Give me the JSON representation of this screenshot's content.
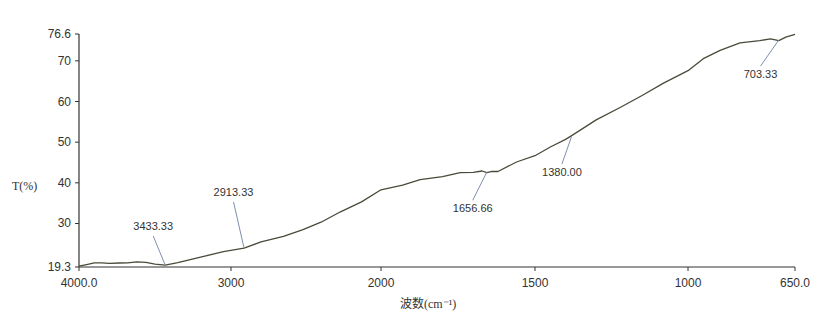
{
  "chart_data": {
    "type": "line",
    "title": "",
    "xlabel": "波数(cm⁻¹)",
    "ylabel": "T(%)",
    "xlim": [
      4000.0,
      650.0
    ],
    "ylim": [
      19.3,
      76.6
    ],
    "x_reversed": true,
    "x_scale_break": 2000,
    "grid": false,
    "legend": null,
    "x_ticks": [
      {
        "value": 4000,
        "label": "4000.0"
      },
      {
        "value": 3000,
        "label": "3000"
      },
      {
        "value": 2000,
        "label": "2000"
      },
      {
        "value": 1500,
        "label": "1500"
      },
      {
        "value": 1000,
        "label": "1000"
      },
      {
        "value": 650,
        "label": "650.0"
      }
    ],
    "y_ticks": [
      {
        "value": 19.3,
        "label": "19.3"
      },
      {
        "value": 30,
        "label": "30"
      },
      {
        "value": 40,
        "label": "40"
      },
      {
        "value": 50,
        "label": "50"
      },
      {
        "value": 60,
        "label": "60"
      },
      {
        "value": 70,
        "label": "70"
      },
      {
        "value": 76.6,
        "label": "76.6"
      }
    ],
    "series": [
      {
        "name": "IR spectrum",
        "color": "#4a4a3a",
        "x": [
          4000,
          3950,
          3900,
          3850,
          3800,
          3735,
          3680,
          3620,
          3560,
          3500,
          3433,
          3350,
          3200,
          3050,
          2913,
          2800,
          2650,
          2520,
          2400,
          2270,
          2130,
          2000,
          1930,
          1873,
          1800,
          1743,
          1700,
          1672,
          1656,
          1640,
          1620,
          1560,
          1500,
          1450,
          1400,
          1380,
          1300,
          1222,
          1150,
          1080,
          1000,
          950,
          895,
          830,
          765,
          730,
          703,
          680,
          650
        ],
        "y": [
          19.5,
          19.6,
          20.0,
          20.3,
          20.5,
          20.6,
          20.4,
          20.3,
          20.1,
          19.9,
          19.8,
          20.3,
          21.8,
          23.0,
          24.0,
          25.4,
          26.9,
          28.4,
          30.4,
          32.8,
          35.4,
          38.2,
          39.5,
          40.7,
          41.6,
          42.4,
          42.7,
          42.8,
          42.6,
          42.7,
          42.9,
          45.0,
          46.8,
          48.7,
          50.8,
          51.5,
          55.6,
          58.4,
          61.6,
          64.4,
          67.7,
          70.4,
          72.7,
          74.3,
          75.1,
          75.3,
          75.1,
          75.7,
          76.6
        ]
      }
    ],
    "annotations": [
      {
        "label": "3433.33",
        "x": 3433.33,
        "y": 19.8
      },
      {
        "label": "2913.33",
        "x": 2913.33,
        "y": 24.0
      },
      {
        "label": "1656.66",
        "x": 1656.66,
        "y": 42.6
      },
      {
        "label": "1380.00",
        "x": 1380.0,
        "y": 51.5
      },
      {
        "label": "703.33",
        "x": 703.33,
        "y": 75.1
      }
    ]
  },
  "layout": {
    "plot_left": 79,
    "plot_right": 795,
    "plot_top": 34,
    "plot_bottom": 267,
    "x_anchors": [
      [
        4000,
        79
      ],
      [
        3000,
        231
      ],
      [
        2000,
        381
      ],
      [
        1500,
        535
      ],
      [
        1000,
        688
      ],
      [
        650,
        795
      ]
    ],
    "line_color": "#4a4a3a",
    "axis_color": "#333333",
    "annotation_line_color": "#7f8fb0",
    "annotation_label_offsets": {
      "3433.33": [
        -34,
        -35
      ],
      "2913.33": [
        -30,
        -52
      ],
      "1656.66": [
        -40,
        40
      ],
      "1380.00": [
        -28,
        40
      ],
      "703.33": [
        -52,
        38
      ]
    }
  }
}
